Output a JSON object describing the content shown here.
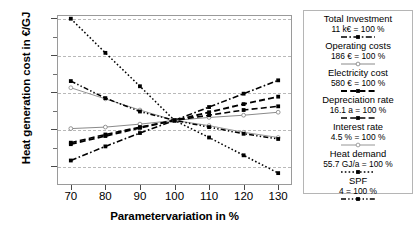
{
  "chart_data": {
    "type": "line",
    "title": "",
    "xlabel": "Parametervariation in %",
    "ylabel": "Heat generation cost in €/GJ",
    "x": [
      70,
      80,
      90,
      100,
      110,
      120,
      130
    ],
    "xlim": [
      66,
      134
    ],
    "ylim": [
      22.5,
      45.4
    ],
    "xticks": [
      "70",
      "80",
      "90",
      "100",
      "110",
      "120",
      "130"
    ],
    "yticks": [
      "25",
      "30",
      "35",
      "40",
      "45"
    ],
    "grid": true,
    "legend_position": "right",
    "series": [
      {
        "name": "Total Investment",
        "unit_label": "11 k€ = 100 %",
        "style": "dash-dot",
        "marker": "filled-square",
        "color": "#000000",
        "width": 1.6,
        "values": [
          25.8,
          27.7,
          29.5,
          31.2,
          33.0,
          34.8,
          36.6
        ]
      },
      {
        "name": "Operating costs",
        "unit_label": "186 € = 100 %",
        "style": "solid",
        "marker": "open-circle",
        "color": "#7d7d7d",
        "width": 0.9,
        "values": [
          30.1,
          30.3,
          30.7,
          31.2,
          31.6,
          31.9,
          32.3
        ]
      },
      {
        "name": "Electricity cost",
        "unit_label": "580 € = 100 %",
        "style": "long-dash",
        "marker": "filled-square",
        "color": "#000000",
        "width": 1.9,
        "values": [
          28.0,
          29.1,
          30.2,
          31.2,
          32.3,
          33.4,
          34.4
        ]
      },
      {
        "name": "Depreciation rate",
        "unit_label": "16.1 a = 100 %",
        "style": "long-dash",
        "marker": "filled-square",
        "color": "#000000",
        "width": 1.6,
        "values": [
          28.2,
          29.3,
          30.3,
          31.2,
          31.9,
          32.6,
          33.1
        ]
      },
      {
        "name": "Interest rate",
        "unit_label": "4.5 % = 100 %",
        "style": "solid",
        "marker": "open-circle",
        "color": "#8a8a8a",
        "width": 0.9,
        "values": [
          35.6,
          34.1,
          32.6,
          31.2,
          30.5,
          29.6,
          28.9
        ]
      },
      {
        "name": "Heat demand",
        "unit_label": "55.7 GJ/a = 100 %",
        "style": "dotted",
        "marker": "filled-square",
        "color": "#000000",
        "width": 1.5,
        "values": [
          44.9,
          40.3,
          35.8,
          31.2,
          28.9,
          26.5,
          24.1
        ]
      },
      {
        "name": "SPF",
        "unit_label": "4 = 100 %",
        "style": "dash-dot-dot",
        "marker": "filled-square",
        "color": "#000000",
        "width": 1.5,
        "values": [
          36.5,
          34.2,
          32.4,
          31.2,
          30.3,
          29.4,
          28.7
        ]
      }
    ]
  }
}
